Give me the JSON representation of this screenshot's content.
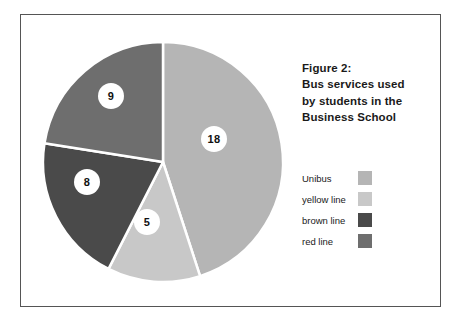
{
  "figure": {
    "title_lines": [
      "Figure 2:",
      "Bus services used",
      "by students in the",
      "Business School"
    ],
    "border_color": "#555555",
    "background_color": "#ffffff"
  },
  "legend": {
    "items": [
      {
        "label": "Unibus",
        "color": "#b5b5b5"
      },
      {
        "label": "yellow line",
        "color": "#c8c8c8"
      },
      {
        "label": "brown line",
        "color": "#4a4a4a"
      },
      {
        "label": "red line",
        "color": "#6e6e6e"
      }
    ]
  },
  "chart_data": {
    "type": "pie",
    "title": "Figure 2: Bus services used by students in the Business School",
    "xlabel": "",
    "ylabel": "",
    "total": 40,
    "start_angle_deg": 0,
    "direction": "clockwise",
    "legend_position": "right",
    "grid": false,
    "categories": [
      "Unibus",
      "yellow line",
      "brown line",
      "red line"
    ],
    "values": [
      18,
      5,
      8,
      9
    ],
    "labels": [
      "18",
      "5",
      "8",
      "9"
    ],
    "colors": [
      "#b5b5b5",
      "#c8c8c8",
      "#4a4a4a",
      "#6e6e6e"
    ],
    "slices": [
      {
        "name": "Unibus",
        "value": 18,
        "label": "18",
        "color": "#b5b5b5",
        "start_deg": 0,
        "end_deg": 162,
        "percent": 45.0,
        "label_x": 214,
        "label_y": 139
      },
      {
        "name": "yellow line",
        "value": 5,
        "label": "5",
        "color": "#c8c8c8",
        "start_deg": 162,
        "end_deg": 207,
        "percent": 12.5,
        "label_x": 147,
        "label_y": 222
      },
      {
        "name": "brown line",
        "value": 8,
        "label": "8",
        "color": "#4a4a4a",
        "start_deg": 207,
        "end_deg": 279,
        "percent": 20.0,
        "label_x": 87,
        "label_y": 182
      },
      {
        "name": "red line",
        "value": 9,
        "label": "9",
        "color": "#6e6e6e",
        "start_deg": 279,
        "end_deg": 360,
        "percent": 22.5,
        "label_x": 111,
        "label_y": 96
      }
    ],
    "geometry": {
      "center_x": 163,
      "center_y": 162,
      "radius": 120,
      "separator_color": "#ffffff",
      "separator_width": 2.5
    }
  }
}
